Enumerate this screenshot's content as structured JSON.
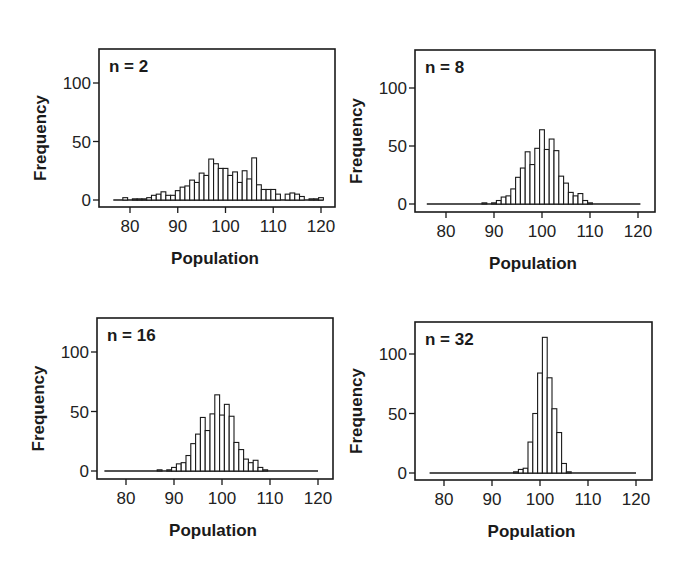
{
  "figure": {
    "axis": {
      "xlabel": "Population",
      "ylabel": "Frequency"
    }
  },
  "chart_data": [
    {
      "type": "bar",
      "title": "n = 2",
      "xlabel": "Population",
      "ylabel": "Frequency",
      "xlim": [
        76,
        121
      ],
      "ylim": [
        0,
        125
      ],
      "xticks": [
        80,
        90,
        100,
        110,
        120
      ],
      "yticks": [
        0,
        50,
        100
      ],
      "grid": false,
      "bin_width": 1,
      "x": [
        76,
        77,
        78,
        79,
        80,
        81,
        82,
        83,
        84,
        85,
        86,
        87,
        88,
        89,
        90,
        91,
        92,
        93,
        94,
        95,
        96,
        97,
        98,
        99,
        100,
        101,
        102,
        103,
        104,
        105,
        106,
        107,
        108,
        109,
        110,
        111,
        112,
        113,
        114,
        115,
        116,
        117,
        118,
        119,
        120
      ],
      "values": [
        0,
        0,
        0,
        2,
        0,
        1,
        1,
        1,
        2,
        4,
        5,
        7,
        4,
        4,
        8,
        11,
        12,
        17,
        15,
        23,
        21,
        35,
        31,
        27,
        27,
        21,
        24,
        15,
        25,
        18,
        36,
        13,
        9,
        9,
        9,
        5,
        0,
        5,
        6,
        5,
        3,
        0,
        1,
        1,
        2
      ]
    },
    {
      "type": "bar",
      "title": "n = 8",
      "xlabel": "Population",
      "ylabel": "Frequency",
      "xlim": [
        76,
        121
      ],
      "ylim": [
        0,
        125
      ],
      "xticks": [
        80,
        90,
        100,
        110,
        120
      ],
      "yticks": [
        0,
        50,
        100
      ],
      "grid": false,
      "bin_width": 1,
      "x": [
        86,
        87,
        88,
        89,
        90,
        91,
        92,
        93,
        94,
        95,
        96,
        97,
        98,
        99,
        100,
        101,
        102,
        103,
        104,
        105,
        106,
        107,
        108,
        109,
        110
      ],
      "values": [
        0,
        0,
        1,
        0,
        1,
        3,
        6,
        7,
        13,
        23,
        31,
        45,
        34,
        48,
        64,
        47,
        56,
        46,
        24,
        18,
        10,
        7,
        9,
        3,
        1
      ]
    },
    {
      "type": "bar",
      "title": "n = 16",
      "xlabel": "Population",
      "ylabel": "Frequency",
      "xlim": [
        75,
        120
      ],
      "ylim": [
        0,
        125
      ],
      "xticks": [
        80,
        90,
        100,
        110,
        120
      ],
      "yticks": [
        0,
        50,
        100
      ],
      "grid": false,
      "bin_width": 1,
      "x": [
        86,
        87,
        88,
        89,
        90,
        91,
        92,
        93,
        94,
        95,
        96,
        97,
        98,
        99,
        100,
        101,
        102,
        103,
        104,
        105,
        106,
        107,
        108,
        109,
        110
      ],
      "values": [
        0,
        1,
        0,
        1,
        3,
        6,
        7,
        13,
        23,
        31,
        45,
        34,
        48,
        64,
        47,
        56,
        46,
        24,
        18,
        10,
        7,
        9,
        3,
        1,
        0
      ]
    },
    {
      "type": "bar",
      "title": "n = 32",
      "xlabel": "Population",
      "ylabel": "Frequency",
      "xlim": [
        76,
        121
      ],
      "ylim": [
        0,
        125
      ],
      "xticks": [
        80,
        90,
        100,
        110,
        120
      ],
      "yticks": [
        0,
        50,
        100
      ],
      "grid": false,
      "bin_width": 1,
      "x": [
        94,
        95,
        96,
        97,
        98,
        99,
        100,
        101,
        102,
        103,
        104,
        105,
        106
      ],
      "values": [
        0,
        1,
        3,
        4,
        26,
        50,
        84,
        114,
        80,
        54,
        34,
        8,
        1
      ]
    }
  ],
  "panels": [
    {
      "label": "n = 2",
      "xlabel": "Population",
      "ylabel": "Frequency",
      "xtick_labels": [
        "80",
        "90",
        "100",
        "110",
        "120"
      ],
      "ytick_labels": [
        "0",
        "50",
        "100"
      ]
    },
    {
      "label": "n = 8",
      "xlabel": "Population",
      "ylabel": "Frequency",
      "xtick_labels": [
        "80",
        "90",
        "100",
        "110",
        "120"
      ],
      "ytick_labels": [
        "0",
        "50",
        "100"
      ]
    },
    {
      "label": "n = 16",
      "xlabel": "Population",
      "ylabel": "Frequency",
      "xtick_labels": [
        "80",
        "90",
        "100",
        "110",
        "120"
      ],
      "ytick_labels": [
        "0",
        "50",
        "100"
      ]
    },
    {
      "label": "n = 32",
      "xlabel": "Population",
      "ylabel": "Frequency",
      "xtick_labels": [
        "80",
        "90",
        "100",
        "110",
        "120"
      ],
      "ytick_labels": [
        "0",
        "50",
        "100"
      ]
    }
  ],
  "colors": {
    "bar_fill": "#ffffff",
    "bar_stroke": "#1a1a1a",
    "axis": "#1a1a1a",
    "background": "#ffffff"
  }
}
